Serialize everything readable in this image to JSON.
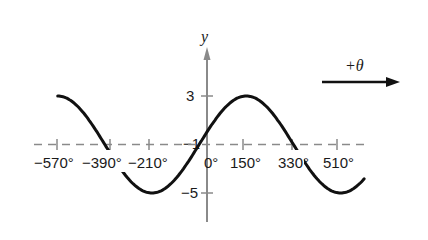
{
  "chart_data": {
    "type": "line",
    "title": "",
    "function": "y = 4 sin((θ + 30°)/2) − 1",
    "xlabel": "θ",
    "ylabel": "y",
    "direction_annotation": "+θ",
    "x_ticks": [
      -570,
      -390,
      -210,
      0,
      150,
      330,
      510
    ],
    "x_tick_labels": [
      "−570°",
      "−390°",
      "−210°",
      "0°",
      "150°",
      "330°",
      "510°"
    ],
    "y_ticks": [
      3,
      -1,
      -5
    ],
    "y_tick_labels": [
      "3",
      "−1",
      "−5"
    ],
    "midline": -1,
    "amplitude": 4,
    "period_deg": 720,
    "xlim": [
      -570,
      600
    ],
    "ylim": [
      -7,
      5
    ],
    "series": [
      {
        "name": "curve",
        "x": [
          -570,
          -390,
          -210,
          -30,
          150,
          330,
          510,
          600
        ],
        "y": [
          3,
          -1,
          -5,
          -1,
          3,
          -1,
          -5,
          -3.83
        ]
      }
    ],
    "grid": false,
    "legend": null
  },
  "colors": {
    "curve": "#111111",
    "axis": "#8a8a8a",
    "midline": "#8a8a8a",
    "text": "#1a1a1a"
  }
}
